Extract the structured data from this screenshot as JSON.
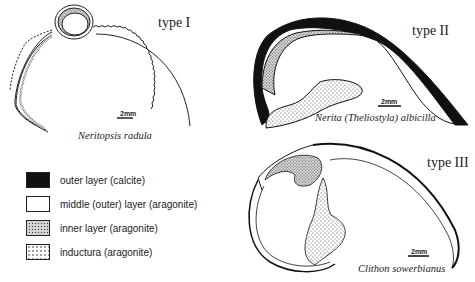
{
  "panels": [
    {
      "type_label": "type I",
      "species": "Neritopsis radula",
      "scale_label": "2mm"
    },
    {
      "type_label": "type II",
      "species": "Nerita (Theliostyla) albicilla",
      "scale_label": "2mm"
    },
    {
      "type_label": "type III",
      "species": "Clithon sowerbianus",
      "scale_label": "2mm"
    }
  ],
  "legend": [
    {
      "label": "outer layer (calcite)",
      "pattern": "solid-black"
    },
    {
      "label": "middle (outer) layer (aragonite)",
      "pattern": "white"
    },
    {
      "label": "inner layer (aragonite)",
      "pattern": "dense-stipple"
    },
    {
      "label": "inductura (aragonite)",
      "pattern": "sparse-stipple"
    }
  ],
  "colors": {
    "ink": "#111111",
    "paper": "#ffffff"
  }
}
